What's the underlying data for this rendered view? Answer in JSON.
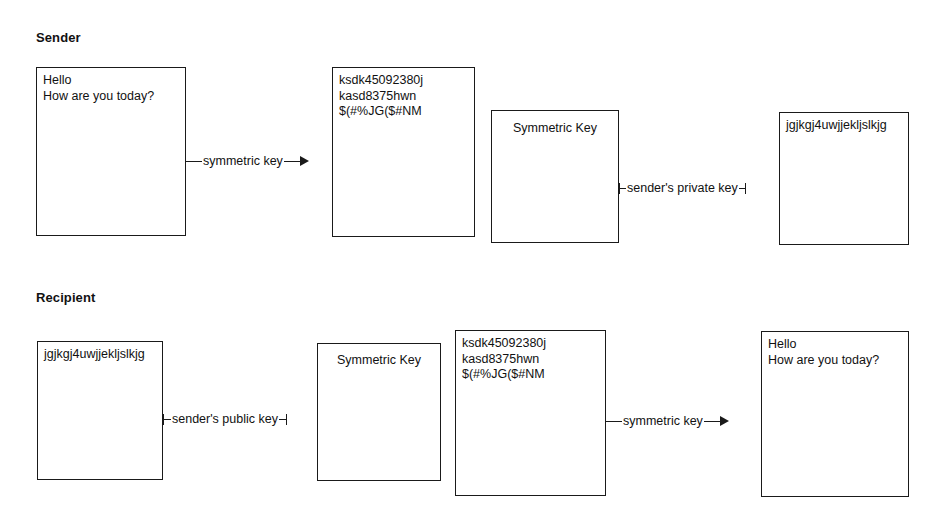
{
  "diagram": {
    "sections": [
      {
        "id": "sender",
        "heading": "Sender"
      },
      {
        "id": "recipient",
        "heading": "Recipient"
      }
    ],
    "sender_row": {
      "plaintext_box": {
        "label": "plaintext-message",
        "text": "Hello\nHow are you today?"
      },
      "ciphertext_box": {
        "label": "ciphertext-message",
        "text": "ksdk45092380j\nkasd8375hwn\n$(#%JG($#NM"
      },
      "symmetric_key_box": {
        "label": "symmetric-key",
        "text": "Symmetric Key"
      },
      "encrypted_key_box": {
        "label": "signed-symmetric-key",
        "text": "jgjkgj4uwjjekljslkjg"
      },
      "connector_1": {
        "label": "symmetric key",
        "has_arrow": true
      },
      "connector_2": {
        "label": "sender's private key",
        "has_arrow": false
      }
    },
    "recipient_row": {
      "encrypted_key_box": {
        "label": "signed-symmetric-key",
        "text": "jgjkgj4uwjjekljslkjg"
      },
      "symmetric_key_box": {
        "label": "symmetric-key",
        "text": "Symmetric Key"
      },
      "ciphertext_box": {
        "label": "ciphertext-message",
        "text": "ksdk45092380j\nkasd8375hwn\n$(#%JG($#NM"
      },
      "plaintext_box": {
        "label": "plaintext-message",
        "text": "Hello\nHow are you today?"
      },
      "connector_1": {
        "label": "sender's public key",
        "has_arrow": false
      },
      "connector_2": {
        "label": "symmetric key",
        "has_arrow": true
      }
    },
    "colors": {
      "stroke": "#1a1a1a",
      "text": "#111111",
      "background": "#ffffff"
    }
  }
}
